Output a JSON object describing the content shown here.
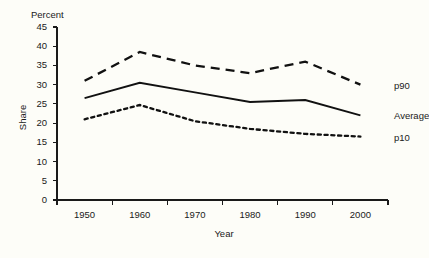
{
  "chart_data": {
    "type": "line",
    "title": "",
    "subtitle": "",
    "unit_label": "Percent",
    "xlabel": "Year",
    "ylabel": "Share",
    "x": [
      1950,
      1960,
      1970,
      1980,
      1990,
      2000
    ],
    "xtick_labels": [
      "1950",
      "1960",
      "1970",
      "1980",
      "1990",
      "2000"
    ],
    "ytick_labels": [
      "0",
      "5",
      "10",
      "15",
      "20",
      "25",
      "30",
      "35",
      "40",
      "45"
    ],
    "ytick_values": [
      0,
      5,
      10,
      15,
      20,
      25,
      30,
      35,
      40,
      45
    ],
    "ylim": [
      0,
      45
    ],
    "xlim": [
      1945,
      2005
    ],
    "grid": false,
    "legend_position": "right-inline",
    "series": [
      {
        "name": "p90",
        "label": "p90",
        "style": "dashed",
        "color": "#111111",
        "values": [
          31.0,
          38.5,
          35.0,
          33.0,
          36.0,
          30.0
        ]
      },
      {
        "name": "Average",
        "label": "Average",
        "style": "solid",
        "color": "#111111",
        "values": [
          26.5,
          30.5,
          28.0,
          25.5,
          26.0,
          22.0
        ]
      },
      {
        "name": "p10",
        "label": "p10",
        "style": "dotted",
        "color": "#111111",
        "values": [
          21.0,
          24.7,
          20.5,
          18.5,
          17.2,
          16.5
        ]
      }
    ]
  },
  "colors": {
    "background": "#fdfdf8",
    "ink": "#1a1a1a",
    "series_ink": "#111111"
  }
}
